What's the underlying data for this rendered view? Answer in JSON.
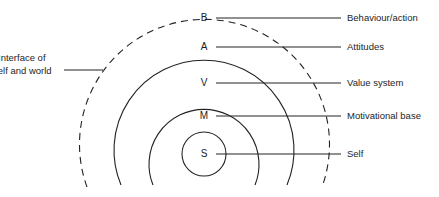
{
  "diagram": {
    "type": "concentric-layers",
    "colors": {
      "stroke": "#222222",
      "text": "#1e1e1e",
      "background": "#ffffff"
    },
    "layers": [
      {
        "letter": "B",
        "label": "Behaviour/action"
      },
      {
        "letter": "A",
        "label": "Attitudes"
      },
      {
        "letter": "V",
        "label": "Value system"
      },
      {
        "letter": "M",
        "label": "Motivational base"
      },
      {
        "letter": "S",
        "label": "Self"
      }
    ],
    "interface": {
      "line1": "Interface of",
      "line2": "self and world"
    }
  }
}
